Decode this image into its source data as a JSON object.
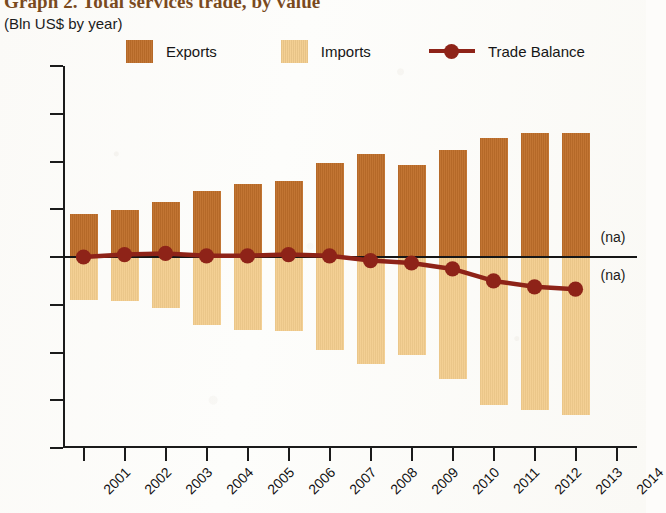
{
  "header": {
    "title": "Graph 2. Total services trade, by value",
    "subtitle": "(Bln US$ by year)"
  },
  "legend": {
    "position": "top",
    "items": [
      {
        "label": "Exports",
        "color": "#bf6f2a",
        "marker": "square"
      },
      {
        "label": "Imports",
        "color": "#f3cd8e",
        "marker": "square"
      },
      {
        "label": "Trade Balance",
        "color": "#8e2318",
        "marker": "line-dot"
      }
    ]
  },
  "annotations": [
    {
      "name": "na-upper",
      "text": "(na)",
      "x_year": "2014",
      "y_value": 8
    },
    {
      "name": "na-lower",
      "text": "(na)",
      "x_year": "2014",
      "y_value": -8
    }
  ],
  "chart_data": {
    "type": "bar",
    "title": "Graph 2. Total services trade, by value",
    "subtitle": "(Bln US$ by year)",
    "xlabel": "",
    "ylabel": "Bln US$",
    "ylim": [
      -80,
      80
    ],
    "yticks": [
      80,
      60,
      40,
      20,
      0,
      -20,
      -40,
      -60,
      -80
    ],
    "ytick_labels": [
      "80",
      "60",
      "40",
      "20",
      "0",
      "–20",
      "–40",
      "–60",
      "–80"
    ],
    "xticks": [
      "2001",
      "2002",
      "2003",
      "2004",
      "2005",
      "2006",
      "2007",
      "2008",
      "2009",
      "2010",
      "2011",
      "2012",
      "2013",
      "2014"
    ],
    "categories": [
      "2001",
      "2002",
      "2003",
      "2004",
      "2005",
      "2006",
      "2007",
      "2008",
      "2009",
      "2010",
      "2011",
      "2012",
      "2013"
    ],
    "grid": false,
    "legend_position": "top",
    "series": [
      {
        "name": "Exports",
        "type": "bar",
        "color": "#bf6f2a",
        "values": [
          18,
          19.5,
          23,
          27.5,
          30.5,
          32,
          39.5,
          43,
          38.5,
          45,
          50,
          52,
          52
        ]
      },
      {
        "name": "Imports",
        "type": "bar",
        "color": "#f3cd8e",
        "values": [
          -18,
          -18.5,
          -21.5,
          -28.5,
          -30.5,
          -31,
          -39,
          -45,
          -41,
          -51,
          -62,
          -64,
          -66
        ]
      },
      {
        "name": "Trade Balance",
        "type": "line",
        "color": "#8e2318",
        "values": [
          0,
          1,
          1.5,
          0.5,
          0.5,
          1,
          0.5,
          -1.5,
          -2.5,
          -5,
          -10,
          -12.5,
          -13.5
        ]
      }
    ]
  }
}
